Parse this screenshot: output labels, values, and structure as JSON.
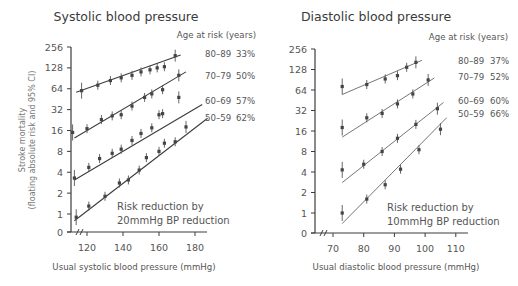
{
  "chart_data": [
    {
      "type": "scatter",
      "title": "Systolic blood pressure",
      "xlabel": "Usual systolic blood pressure (mmHg)",
      "ylabel": "Stroke mortality (floating absolute risk and 95% CI)",
      "yscale": "log2",
      "x_ticks": [
        120,
        140,
        160,
        180
      ],
      "y_ticks": [
        "256",
        "128",
        "64",
        "32",
        "16",
        "8",
        "4",
        "2",
        "1",
        "0"
      ],
      "xlim": [
        112,
        187
      ],
      "legend_title": "Age at risk (years)",
      "annotation": [
        "Risk reduction by",
        "20mmHg BP reduction"
      ],
      "series": [
        {
          "name": "80-89",
          "reduction": "33%",
          "x": [
            117,
            126,
            133,
            139,
            145,
            150,
            155,
            159,
            163,
            169
          ],
          "y": [
            60,
            72,
            84,
            92,
            100,
            112,
            120,
            128,
            133,
            192
          ],
          "fit": [
            [
              114,
              57
            ],
            [
              172,
              196
            ]
          ]
        },
        {
          "name": "70-79",
          "reduction": "50%",
          "x": [
            112,
            120,
            128,
            134,
            139,
            145,
            152,
            156,
            162,
            171
          ],
          "y": [
            15,
            17,
            23,
            26,
            27,
            36,
            48,
            54,
            62,
            100
          ],
          "fit": [
            [
              113,
              12.5
            ],
            [
              175,
              112
            ]
          ]
        },
        {
          "name": "60-69",
          "reduction": "57%",
          "x": [
            113,
            121,
            127,
            134,
            139,
            145,
            150,
            156,
            160,
            162,
            171
          ],
          "y": [
            3.3,
            4.7,
            6.3,
            7.5,
            8.6,
            11.5,
            14.5,
            17.5,
            27,
            28,
            48
          ],
          "fit": [
            [
              113,
              3.1
            ],
            [
              184,
              38
            ]
          ]
        },
        {
          "name": "50-59",
          "reduction": "62%",
          "x": [
            114,
            121,
            130,
            138,
            143,
            149,
            153,
            160,
            163,
            169,
            175
          ],
          "y": [
            0.9,
            1.3,
            1.8,
            2.8,
            3.1,
            4.3,
            6.5,
            8,
            10.5,
            11,
            18
          ],
          "fit": [
            [
              113,
              0.8
            ],
            [
              187,
              24
            ]
          ]
        }
      ]
    },
    {
      "type": "scatter",
      "title": "Diastolic blood pressure",
      "xlabel": "Usual diastolic blood pressure (mmHg)",
      "ylabel": "",
      "yscale": "log2",
      "x_ticks": [
        70,
        80,
        90,
        100,
        110
      ],
      "y_ticks": [
        "256",
        "128",
        "64",
        "32",
        "16",
        "8",
        "4",
        "2",
        "1",
        "0"
      ],
      "xlim": [
        66,
        114
      ],
      "legend_title": "Age at risk (years)",
      "annotation": [
        "Risk reduction by",
        "10mmHg BP reduction"
      ],
      "series": [
        {
          "name": "80-89",
          "reduction": "37%",
          "x": [
            73,
            81,
            87,
            91,
            94,
            97
          ],
          "y": [
            72,
            77,
            93,
            104,
            138,
            163
          ],
          "fit": [
            [
              73,
              55
            ],
            [
              99,
              175
            ]
          ]
        },
        {
          "name": "70-79",
          "reduction": "52%",
          "x": [
            73,
            81,
            86,
            91,
            96,
            101
          ],
          "y": [
            18,
            25,
            29,
            40,
            56,
            90
          ],
          "fit": [
            [
              73,
              13
            ],
            [
              103,
              96
            ]
          ]
        },
        {
          "name": "60-69",
          "reduction": "60%",
          "x": [
            73,
            80,
            86,
            91,
            97,
            104
          ],
          "y": [
            4.3,
            5.2,
            8,
            12.5,
            20,
            34
          ],
          "fit": [
            [
              73,
              2.8
            ],
            [
              106,
              42
            ]
          ]
        },
        {
          "name": "50-59",
          "reduction": "66%",
          "x": [
            73,
            81,
            87,
            92,
            98,
            105
          ],
          "y": [
            1,
            1.6,
            2.6,
            4.4,
            8.5,
            17
          ],
          "fit": [
            [
              73,
              0.7
            ],
            [
              107,
              25
            ]
          ]
        }
      ]
    }
  ],
  "left": {
    "title": "Systolic blood pressure",
    "legend_title": "Age at risk (years)",
    "ylabel_line1": "Stroke mortality",
    "ylabel_line2": "(floating absolute risk and 95% CI)",
    "xlabel": "Usual systolic blood pressure (mmHg)",
    "note1": "Risk reduction by",
    "note2": "20mmHg BP reduction",
    "series_labels": [
      {
        "age": "80–89",
        "pct": "33%"
      },
      {
        "age": "70–79",
        "pct": "50%"
      },
      {
        "age": "60–69",
        "pct": "57%"
      },
      {
        "age": "50–59",
        "pct": "62%"
      }
    ]
  },
  "right": {
    "title": "Diastolic blood pressure",
    "legend_title": "Age at risk (years)",
    "xlabel": "Usual diastolic blood pressure (mmHg)",
    "note1": "Risk reduction by",
    "note2": "10mmHg BP reduction",
    "series_labels": [
      {
        "age": "80–89",
        "pct": "37%"
      },
      {
        "age": "70–79",
        "pct": "52%"
      },
      {
        "age": "60–69",
        "pct": "60%"
      },
      {
        "age": "50–59",
        "pct": "66%"
      }
    ]
  }
}
